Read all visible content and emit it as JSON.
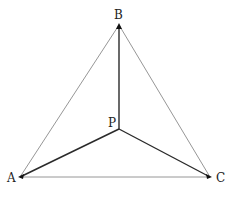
{
  "diagram": {
    "type": "geometry-triangle",
    "points": {
      "A": {
        "label": "A",
        "x": 20,
        "y": 177,
        "label_x": 7,
        "label_y": 182
      },
      "B": {
        "label": "B",
        "x": 119,
        "y": 25,
        "label_x": 114,
        "label_y": 19
      },
      "C": {
        "label": "C",
        "x": 210,
        "y": 177,
        "label_x": 216,
        "label_y": 182
      },
      "P": {
        "label": "P",
        "x": 119,
        "y": 129,
        "label_x": 108,
        "label_y": 127
      }
    },
    "edges_outer": [
      {
        "from": "A",
        "to": "B"
      },
      {
        "from": "B",
        "to": "C"
      },
      {
        "from": "A",
        "to": "C"
      }
    ],
    "edges_inner": [
      {
        "from": "P",
        "to": "A"
      },
      {
        "from": "P",
        "to": "B"
      },
      {
        "from": "P",
        "to": "C"
      }
    ],
    "colors": {
      "outer_line": "#8a8a8a",
      "inner_line": "#2a2a2a",
      "vertex_mark": "#111111",
      "label": "#222222"
    }
  }
}
